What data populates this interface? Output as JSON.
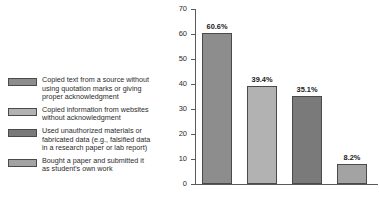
{
  "chart_data": {
    "type": "bar",
    "title": "",
    "xlabel": "",
    "ylabel": "",
    "ylim": [
      0,
      70
    ],
    "ytick_step": 10,
    "yticks": [
      "70",
      "60",
      "50",
      "40",
      "30",
      "20",
      "10",
      "0"
    ],
    "grid": false,
    "legend_position": "left",
    "categories": [
      "Copied text from a source without using quotation marks or giving proper acknowledgment",
      "Copied information from websites without acknowledgment",
      "Used unauthorized materials or fabricated data (e.g., falsified data in a research paper or lab report)",
      "Bought a paper and submitted it as student's own work"
    ],
    "values": [
      60.6,
      39.4,
      35.1,
      8.2
    ],
    "data_labels": [
      "60.6%",
      "39.4%",
      "35.1%",
      "8.2%"
    ],
    "bar_colors": [
      "#8d8d8d",
      "#b2b2b2",
      "#7a7a7a",
      "#a3a3a3"
    ]
  },
  "legend": {
    "items": [
      {
        "swatch_color": "#8d8d8d",
        "lines": [
          "Copied text from a source without",
          "using quotation marks or giving",
          "proper acknowledgment"
        ]
      },
      {
        "swatch_color": "#b2b2b2",
        "lines": [
          "Copied information from websites",
          "without acknowledgment"
        ]
      },
      {
        "swatch_color": "#7a7a7a",
        "lines": [
          "Used unauthorized materials or",
          "fabricated data (e.g., falsified data",
          "in a research paper or lab report)"
        ]
      },
      {
        "swatch_color": "#a3a3a3",
        "lines": [
          "Bought a paper and submitted it",
          "as student's own work"
        ]
      }
    ]
  },
  "axis": {
    "line_color": "#5a5a5a",
    "label_color": "#2b2b2b"
  }
}
